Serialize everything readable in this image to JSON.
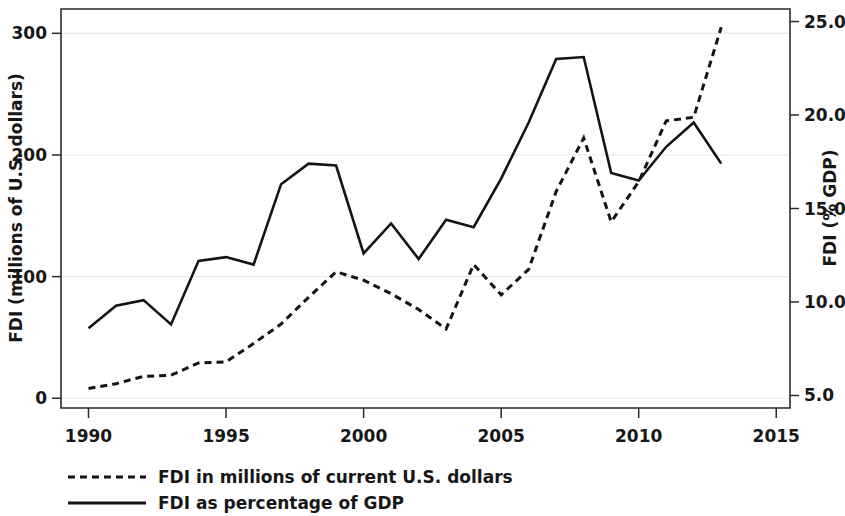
{
  "chart_data": {
    "type": "line",
    "title": "",
    "subtitle": "",
    "xlabel": "",
    "ylabel": "FDI (millions of U.S. dollars)",
    "y2label": "FDI (% GDP)",
    "grid": true,
    "legend_position": "bottom-left",
    "x": [
      1990,
      1991,
      1992,
      1993,
      1994,
      1995,
      1996,
      1997,
      1998,
      1999,
      2000,
      2001,
      2002,
      2003,
      2004,
      2005,
      2006,
      2007,
      2008,
      2009,
      2010,
      2011,
      2012,
      2013
    ],
    "xlim": [
      1989,
      2015.5
    ],
    "xticks": [
      1990,
      1995,
      2000,
      2005,
      2010,
      2015
    ],
    "xticklabels": [
      "1990",
      "1995",
      "2000",
      "2005",
      "2010",
      "2015"
    ],
    "ylim": [
      -8,
      320
    ],
    "yticks": [
      0,
      100,
      200,
      300
    ],
    "yticklabels": [
      "0",
      "100",
      "200",
      "300"
    ],
    "y2lim": [
      4.33,
      25.67
    ],
    "y2ticks": [
      5.0,
      10.0,
      15.0,
      20.0,
      25.0
    ],
    "y2ticklabels": [
      "5.0",
      "10.0",
      "15.0",
      "20.0",
      "25.0"
    ],
    "series": [
      {
        "name": "FDI in millions of current U.S. dollars",
        "axis": "left",
        "style": "dashed",
        "color": "#141414",
        "values": [
          8,
          12,
          18,
          19,
          29,
          30,
          45,
          61,
          83,
          104,
          97,
          86,
          73,
          57,
          110,
          85,
          106,
          170,
          214,
          145,
          178,
          228,
          231,
          305
        ]
      },
      {
        "name": "FDI as percentage of GDP",
        "axis": "right",
        "style": "solid",
        "color": "#141414",
        "values": [
          8.6,
          9.8,
          10.1,
          8.8,
          12.2,
          12.4,
          12.0,
          16.3,
          17.4,
          17.3,
          12.6,
          14.2,
          12.3,
          14.4,
          14.0,
          16.6,
          19.6,
          23.0,
          23.1,
          16.9,
          16.5,
          18.3,
          19.6,
          17.4
        ]
      }
    ],
    "series_plot_left_equivalent": {
      "note_axis": "right-axis series rendered against left pixel scale",
      "values": [
        57,
        82,
        87,
        62,
        118,
        120,
        114,
        193,
        206,
        204,
        127,
        155,
        120,
        157,
        148,
        198,
        269,
        295,
        297,
        185,
        178,
        200,
        220,
        182
      ]
    },
    "legend": [
      {
        "label": "FDI in millions of current U.S. dollars",
        "style": "dashed"
      },
      {
        "label": "FDI as percentage of GDP",
        "style": "solid"
      }
    ]
  },
  "axes": {
    "left_title": "FDI (millions of U.S. dollars)",
    "right_title": "FDI (% GDP)"
  },
  "legend": {
    "item1": "FDI in millions of current U.S. dollars",
    "item2": "FDI as percentage of GDP"
  }
}
